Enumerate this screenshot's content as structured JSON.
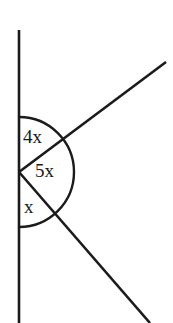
{
  "figure": {
    "background_color": "#ffffff",
    "stroke_color": "#1b1b1b",
    "text_color": "#1a1a1a",
    "vertex": {
      "x": 19,
      "y": 172
    },
    "labels": {
      "upper_angle": "4x",
      "middle_angle": "5x",
      "lower_angle": "x"
    },
    "label_positions": {
      "upper_angle": {
        "x": 23,
        "y": 139
      },
      "middle_angle": {
        "x": 35,
        "y": 173
      },
      "lower_angle": {
        "x": 24,
        "y": 209
      }
    },
    "lines": [
      {
        "name": "vertical-line",
        "x1": 19,
        "y1": 30,
        "x2": 19,
        "y2": 323,
        "width": 2.6
      },
      {
        "name": "upper-ray",
        "x1": 19,
        "y1": 172,
        "x2": 166,
        "y2": 62,
        "width": 2.6
      },
      {
        "name": "lower-ray",
        "x1": 19,
        "y1": 172,
        "x2": 150,
        "y2": 323,
        "width": 2.6
      }
    ],
    "arc": {
      "name": "angle-arc",
      "center_x": 19,
      "center_y": 172,
      "radius": 55,
      "start_x": 19,
      "start_y": 117,
      "end_x": 19,
      "end_y": 227,
      "width": 2.4,
      "path": "M 19 117 A 55 55 0 0 1 19 227"
    }
  },
  "chart_data": {
    "type": "diagram",
    "angles": [
      {
        "label": "4x",
        "coefficient": 4,
        "region": "between upward vertical and upper ray",
        "value_degrees": 72
      },
      {
        "label": "5x",
        "coefficient": 5,
        "region": "between upper ray and lower ray",
        "value_degrees": 90
      },
      {
        "label": "x",
        "coefficient": 1,
        "region": "between lower ray and downward vertical",
        "value_degrees": 18
      }
    ],
    "total_degrees": 180,
    "equation": "4x + 5x + x = 180",
    "solution_x_degrees": 18
  }
}
